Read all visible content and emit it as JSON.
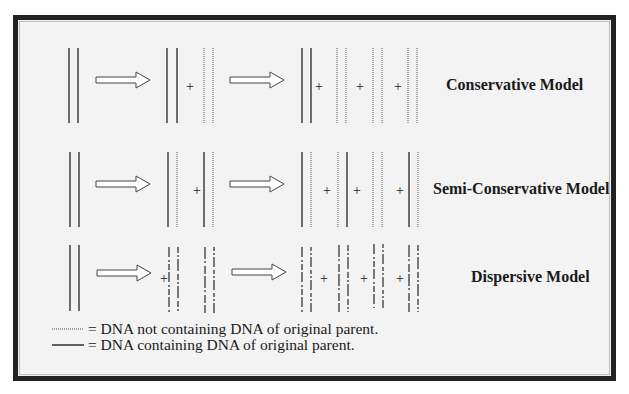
{
  "models": [
    {
      "label": "Conservative Model"
    },
    {
      "label": "Semi-Conservative Model"
    },
    {
      "label": "Dispersive Model"
    }
  ],
  "symbols": {
    "plus": "+",
    "arrow": "hollow-right-arrow"
  },
  "legend": {
    "dotted": "= DNA not containing DNA of original parent.",
    "solid": "= DNA containing DNA of original parent."
  },
  "colors": {
    "frame": "#222222",
    "background": "#f3f3f3",
    "solid_line": "#333333",
    "dotted_line": "#888888"
  }
}
